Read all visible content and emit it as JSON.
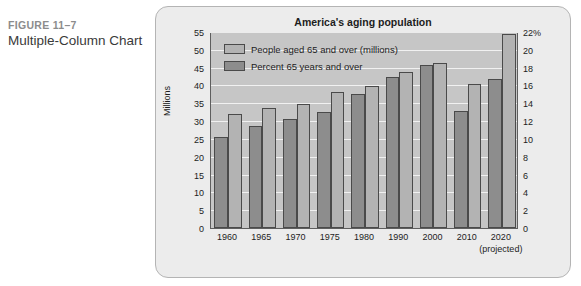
{
  "caption": {
    "figure_number": "FIGURE 11–7",
    "figure_title": "Multiple-Column Chart"
  },
  "chart_data": {
    "type": "bar",
    "title": "America's aging population",
    "xlabel": "",
    "ylabel": "Millions",
    "categories": [
      "1960",
      "1965",
      "1970",
      "1975",
      "1980",
      "1990",
      "2000",
      "2010",
      "2020"
    ],
    "category_notes": {
      "2020": "(projected)"
    },
    "series": [
      {
        "name": "Percent 65 years and over",
        "axis": "right",
        "color": "#8d8d8d",
        "unit": "%",
        "values": [
          10.2,
          11.4,
          12.2,
          13.0,
          15.0,
          17.0,
          18.3,
          13.1,
          16.7
        ]
      },
      {
        "name": "People aged 65 and over (millions)",
        "axis": "left",
        "color": "#b3b3b3",
        "unit": "millions",
        "values": [
          32.0,
          33.6,
          34.8,
          38.1,
          39.9,
          43.8,
          46.3,
          40.3,
          54.5
        ]
      }
    ],
    "left_axis": {
      "label": "Millions",
      "min": 0,
      "max": 55,
      "step": 5,
      "ticks": [
        "0",
        "5",
        "10",
        "15",
        "20",
        "25",
        "30",
        "35",
        "40",
        "45",
        "50",
        "55"
      ]
    },
    "right_axis": {
      "label": "",
      "min": 0,
      "max": 22,
      "step": 2,
      "ticks": [
        "0",
        "2",
        "4",
        "6",
        "8",
        "10",
        "12",
        "14",
        "16",
        "18",
        "20",
        "22%"
      ]
    },
    "grid": true,
    "legend_position": "top-left",
    "legend": [
      {
        "label": "People aged 65 and over (millions)",
        "swatch": "light"
      },
      {
        "label": "Percent 65 years and over",
        "swatch": "dark"
      }
    ],
    "colors": {
      "plot_background": "#c6c6c6",
      "gridline": "#f1f1f1",
      "card_background": "#ececec",
      "series_light": "#b3b3b3",
      "series_dark": "#8d8d8d",
      "axis": "#5e5e5e"
    }
  }
}
